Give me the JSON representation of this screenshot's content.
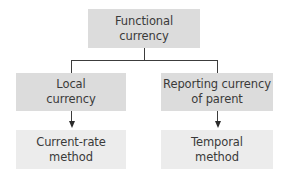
{
  "diagram": {
    "type": "tree",
    "colors": {
      "top_box": "#dcdcdc",
      "middle_box": "#dcdcdc",
      "bottom_box": "#ececec",
      "line": "#3c3c3c",
      "text": "#3a3a3a"
    },
    "nodes": {
      "root": {
        "label": "Functional\ncurrency"
      },
      "left_branch": {
        "label": "Local\ncurrency"
      },
      "right_branch": {
        "label": "Reporting currency\nof parent"
      },
      "left_result": {
        "label": "Current-rate\nmethod"
      },
      "right_result": {
        "label": "Temporal\nmethod"
      }
    },
    "edges": [
      {
        "from": "root",
        "to": "left_branch",
        "style": "line"
      },
      {
        "from": "root",
        "to": "right_branch",
        "style": "line"
      },
      {
        "from": "left_branch",
        "to": "left_result",
        "style": "arrow"
      },
      {
        "from": "right_branch",
        "to": "right_result",
        "style": "arrow"
      }
    ]
  }
}
